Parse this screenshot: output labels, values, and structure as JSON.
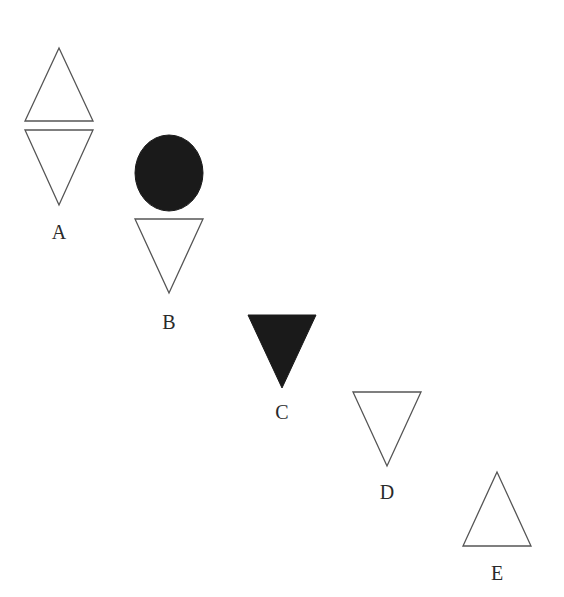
{
  "figures": [
    {
      "label": "A",
      "shapes": [
        {
          "type": "triangle-up",
          "fill": "white",
          "points": "59,48 25,121 93,121"
        },
        {
          "type": "triangle-down",
          "fill": "white",
          "points": "25,130 93,130 59,205"
        }
      ],
      "label_pos": [
        59,
        239
      ]
    },
    {
      "label": "B",
      "shapes": [
        {
          "type": "circle",
          "fill": "black",
          "cx": 169,
          "cy": 173,
          "rx": 34,
          "ry": 38
        },
        {
          "type": "triangle-down",
          "fill": "white",
          "points": "135,219 203,219 169,293"
        }
      ],
      "label_pos": [
        169,
        329
      ]
    },
    {
      "label": "C",
      "shapes": [
        {
          "type": "triangle-down",
          "fill": "black",
          "points": "248,315 316,315 282,388"
        }
      ],
      "label_pos": [
        282,
        419
      ]
    },
    {
      "label": "D",
      "shapes": [
        {
          "type": "triangle-down",
          "fill": "white",
          "points": "353,392 421,392 387,466"
        }
      ],
      "label_pos": [
        387,
        499
      ]
    },
    {
      "label": "E",
      "shapes": [
        {
          "type": "triangle-up",
          "fill": "white",
          "points": "497,472 463,546 531,546"
        }
      ],
      "label_pos": [
        497,
        580
      ]
    }
  ],
  "colors": {
    "background": "#ffffff",
    "stroke": "#555555",
    "fill_dark": "#1a1a1a",
    "label": "#2a2a2a"
  }
}
